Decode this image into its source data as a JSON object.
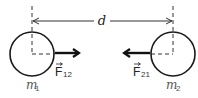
{
  "diagram": {
    "distance_label": "d",
    "masses": [
      {
        "label": "m",
        "subscript": "1",
        "cx": 32,
        "cy": 54,
        "r": 22
      },
      {
        "label": "m",
        "subscript": "2",
        "cx": 173,
        "cy": 54,
        "r": 22
      }
    ],
    "forces": [
      {
        "label": "F",
        "subscript": "12",
        "direction": "right",
        "x1": 55,
        "x2": 80,
        "y": 53
      },
      {
        "label": "F",
        "subscript": "21",
        "direction": "left",
        "x1": 151,
        "x2": 123,
        "y": 53
      }
    ],
    "colors": {
      "stroke": "#1a1a1a",
      "dashed": "#333333",
      "mass_label": "#555555"
    }
  }
}
